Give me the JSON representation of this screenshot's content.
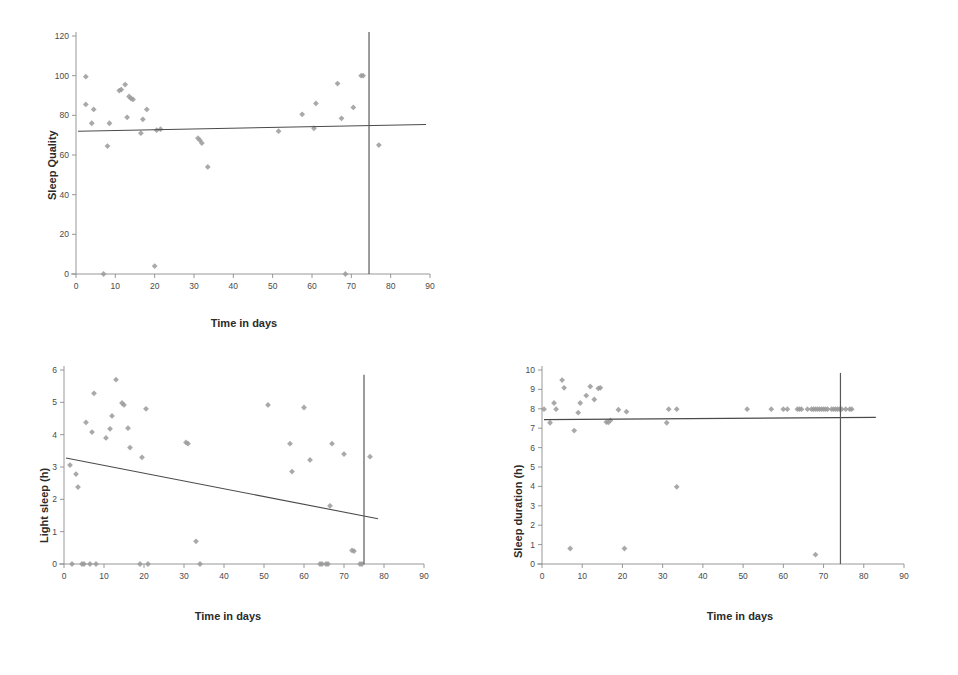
{
  "figure": {
    "background": "#ffffff",
    "marker_color": "#9a9a9a",
    "line_color": "#4a4a4a",
    "axis_color": "#8c8c8c",
    "vline_color": "#595959"
  },
  "chart_data": [
    {
      "id": "sleep-quality",
      "type": "scatter",
      "title": "",
      "xlabel": "Time in days",
      "ylabel": "Sleep Quality",
      "xlim": [
        0,
        90
      ],
      "ylim": [
        0,
        120
      ],
      "xticks": [
        0,
        10,
        20,
        30,
        40,
        50,
        60,
        70,
        80,
        90
      ],
      "yticks": [
        0,
        20,
        40,
        60,
        80,
        100,
        120
      ],
      "grid": false,
      "legend": "none",
      "points": [
        [
          2.5,
          99.5
        ],
        [
          2.5,
          85.5
        ],
        [
          4.0,
          76.0
        ],
        [
          4.5,
          83.0
        ],
        [
          7.0,
          0.0
        ],
        [
          8.0,
          64.5
        ],
        [
          8.5,
          76.0
        ],
        [
          11.0,
          92.5
        ],
        [
          11.5,
          93.0
        ],
        [
          12.5,
          95.5
        ],
        [
          13.0,
          79.0
        ],
        [
          13.5,
          89.5
        ],
        [
          14.0,
          88.5
        ],
        [
          14.5,
          88.0
        ],
        [
          16.5,
          71.0
        ],
        [
          17.0,
          78.0
        ],
        [
          18.0,
          83.0
        ],
        [
          20.0,
          4.0
        ],
        [
          20.5,
          72.5
        ],
        [
          21.5,
          73.0
        ],
        [
          31.0,
          68.5
        ],
        [
          31.5,
          67.5
        ],
        [
          32.0,
          66.0
        ],
        [
          33.5,
          54.0
        ],
        [
          51.5,
          72.0
        ],
        [
          57.5,
          80.5
        ],
        [
          60.5,
          73.5
        ],
        [
          61.0,
          86.0
        ],
        [
          66.5,
          96.0
        ],
        [
          67.5,
          78.5
        ],
        [
          68.5,
          0.0
        ],
        [
          70.5,
          84.0
        ],
        [
          72.5,
          100.0
        ],
        [
          73.0,
          100.0
        ],
        [
          77.0,
          65.0
        ]
      ],
      "trendline": {
        "x": [
          0.5,
          89.0
        ],
        "y": [
          72.0,
          75.4
        ]
      },
      "vline": {
        "x": 74.5,
        "y_from": 0,
        "y_to": 122
      }
    },
    {
      "id": "light-sleep",
      "type": "scatter",
      "title": "",
      "xlabel": "Time in days",
      "ylabel": "Light sleep (h)",
      "xlim": [
        0,
        90
      ],
      "ylim": [
        0,
        6
      ],
      "xticks": [
        0,
        10,
        20,
        30,
        40,
        50,
        60,
        70,
        80,
        90
      ],
      "yticks": [
        0,
        1,
        2,
        3,
        4,
        5,
        6
      ],
      "grid": false,
      "legend": "none",
      "points": [
        [
          1.5,
          3.06
        ],
        [
          2.0,
          0.0
        ],
        [
          3.0,
          2.78
        ],
        [
          3.5,
          2.38
        ],
        [
          4.5,
          0.0
        ],
        [
          5.0,
          0.0
        ],
        [
          5.5,
          4.38
        ],
        [
          6.5,
          0.0
        ],
        [
          7.0,
          4.08
        ],
        [
          7.5,
          5.28
        ],
        [
          8.0,
          0.0
        ],
        [
          10.5,
          3.9
        ],
        [
          11.5,
          4.18
        ],
        [
          12.0,
          4.58
        ],
        [
          13.0,
          5.7
        ],
        [
          14.5,
          4.98
        ],
        [
          15.0,
          4.92
        ],
        [
          16.0,
          4.2
        ],
        [
          16.5,
          3.6
        ],
        [
          19.0,
          0.0
        ],
        [
          19.5,
          3.3
        ],
        [
          20.5,
          4.8
        ],
        [
          21.0,
          0.0
        ],
        [
          30.5,
          3.76
        ],
        [
          31.0,
          3.72
        ],
        [
          33.0,
          0.7
        ],
        [
          34.0,
          0.0
        ],
        [
          51.0,
          4.92
        ],
        [
          56.5,
          3.72
        ],
        [
          57.0,
          2.86
        ],
        [
          60.0,
          4.84
        ],
        [
          61.5,
          3.22
        ],
        [
          64.0,
          0.0
        ],
        [
          64.5,
          0.0
        ],
        [
          65.5,
          0.0
        ],
        [
          66.0,
          0.0
        ],
        [
          66.5,
          1.8
        ],
        [
          67.0,
          3.72
        ],
        [
          70.0,
          3.4
        ],
        [
          72.0,
          0.42
        ],
        [
          72.5,
          0.4
        ],
        [
          74.0,
          0.0
        ],
        [
          74.5,
          0.0
        ],
        [
          76.5,
          3.32
        ]
      ],
      "trendline": {
        "x": [
          0.5,
          78.5
        ],
        "y": [
          3.28,
          1.4
        ]
      },
      "vline": {
        "x": 75.0,
        "y_from": 0,
        "y_to": 5.85
      }
    },
    {
      "id": "sleep-duration",
      "type": "scatter",
      "title": "",
      "xlabel": "Time in days",
      "ylabel": "Sleep duration (h)",
      "xlim": [
        0,
        90
      ],
      "ylim": [
        0,
        10
      ],
      "xticks": [
        0,
        10,
        20,
        30,
        40,
        50,
        60,
        70,
        80,
        90
      ],
      "yticks": [
        0,
        1,
        2,
        3,
        4,
        5,
        6,
        7,
        8,
        9,
        10
      ],
      "grid": false,
      "legend": "none",
      "points": [
        [
          0.5,
          7.98
        ],
        [
          2.0,
          7.28
        ],
        [
          3.0,
          8.3
        ],
        [
          3.5,
          7.98
        ],
        [
          5.0,
          9.48
        ],
        [
          5.5,
          9.08
        ],
        [
          7.0,
          0.8
        ],
        [
          8.0,
          6.88
        ],
        [
          9.0,
          7.8
        ],
        [
          9.5,
          8.3
        ],
        [
          11.0,
          8.68
        ],
        [
          12.0,
          9.15
        ],
        [
          13.0,
          8.48
        ],
        [
          14.0,
          9.05
        ],
        [
          14.5,
          9.08
        ],
        [
          16.0,
          7.32
        ],
        [
          16.5,
          7.3
        ],
        [
          17.0,
          7.4
        ],
        [
          19.0,
          7.95
        ],
        [
          20.5,
          0.8
        ],
        [
          21.0,
          7.85
        ],
        [
          31.0,
          7.28
        ],
        [
          31.5,
          7.98
        ],
        [
          33.5,
          7.98
        ],
        [
          33.5,
          3.98
        ],
        [
          51.0,
          7.98
        ],
        [
          57.0,
          7.98
        ],
        [
          60.0,
          7.98
        ],
        [
          61.0,
          7.98
        ],
        [
          63.5,
          7.98
        ],
        [
          64.0,
          7.98
        ],
        [
          64.5,
          7.98
        ],
        [
          66.0,
          7.98
        ],
        [
          67.0,
          7.98
        ],
        [
          67.5,
          7.98
        ],
        [
          68.0,
          7.98
        ],
        [
          68.0,
          0.48
        ],
        [
          68.5,
          7.98
        ],
        [
          69.0,
          7.98
        ],
        [
          69.5,
          7.98
        ],
        [
          70.0,
          7.98
        ],
        [
          70.5,
          7.98
        ],
        [
          71.0,
          7.98
        ],
        [
          72.0,
          7.98
        ],
        [
          72.5,
          7.98
        ],
        [
          73.0,
          7.98
        ],
        [
          73.5,
          7.98
        ],
        [
          74.0,
          7.98
        ],
        [
          74.5,
          7.98
        ],
        [
          75.5,
          7.98
        ],
        [
          76.5,
          7.98
        ],
        [
          77.0,
          7.98
        ]
      ],
      "trendline": {
        "x": [
          0.5,
          83.0
        ],
        "y": [
          7.44,
          7.56
        ]
      },
      "vline": {
        "x": 74.2,
        "y_from": 0,
        "y_to": 9.85
      }
    }
  ]
}
